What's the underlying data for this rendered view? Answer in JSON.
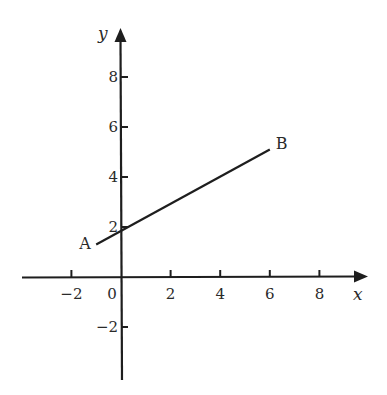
{
  "figure": {
    "title": "",
    "colors": {
      "background": "#ffffff",
      "ink": "#1e1e1e",
      "text": "#2a2a2a"
    }
  },
  "chart_data": {
    "type": "line",
    "title": "",
    "xlabel": "x",
    "ylabel": "y",
    "xlim": [
      -4,
      10
    ],
    "ylim": [
      -4,
      10
    ],
    "grid": false,
    "legend": null,
    "x_ticks": [
      -2,
      2,
      4,
      6,
      8
    ],
    "x_tick_labels": [
      "−2",
      "2",
      "4",
      "6",
      "8"
    ],
    "y_ticks": [
      -2,
      2,
      4,
      6,
      8
    ],
    "y_tick_labels": [
      "−2",
      "2",
      "4",
      "6",
      "8"
    ],
    "origin_label": "0",
    "series": [
      {
        "name": "AB",
        "x": [
          -1,
          6
        ],
        "y": [
          1.3,
          5.1
        ]
      }
    ],
    "annotations": [
      {
        "text": "A",
        "x": -1,
        "y": 1.3
      },
      {
        "text": "B",
        "x": 6,
        "y": 5.1
      }
    ]
  },
  "labels": {
    "x_axis": "x",
    "y_axis": "y",
    "origin": "0",
    "point_a": "A",
    "point_b": "B",
    "x_ticks": [
      "−2",
      "2",
      "4",
      "6",
      "8"
    ],
    "y_ticks": [
      "−2",
      "2",
      "4",
      "6",
      "8"
    ]
  }
}
